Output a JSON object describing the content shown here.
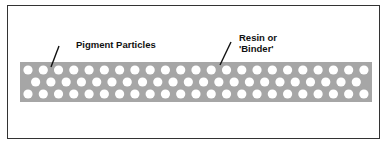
{
  "diagram": {
    "labels": {
      "pigment": "Pigment Particles",
      "resin_line1": "Resin or",
      "resin_line2": "'Binder'"
    },
    "colors": {
      "band": "#a6a6a6",
      "particle": "#ffffff",
      "frame": "#333333",
      "leader": "#111111"
    },
    "band": {
      "x": 20,
      "y": 62,
      "width": 352,
      "height": 40
    },
    "particles": {
      "rows": 3,
      "per_full_row": 23,
      "per_offset_row": 22,
      "spacing": 15.27,
      "radius": 4.6,
      "row_y": [
        70,
        82,
        94
      ],
      "start_x": 28
    }
  }
}
